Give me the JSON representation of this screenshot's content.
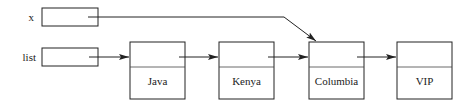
{
  "variables": [
    {
      "name": "x",
      "points_to": "Columbia"
    },
    {
      "name": "list",
      "points_to": "Java"
    }
  ],
  "nodes": [
    {
      "value": "Java"
    },
    {
      "value": "Kenya"
    },
    {
      "value": "Columbia"
    },
    {
      "value": "VIP"
    }
  ],
  "colors": {
    "stroke": "#222222",
    "background": "#ffffff"
  }
}
